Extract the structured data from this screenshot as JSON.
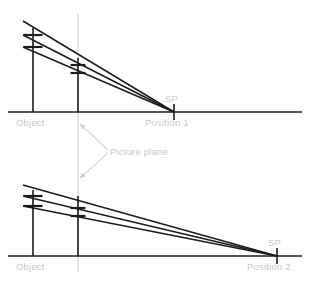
{
  "figure": {
    "background": "#ffffff",
    "line_color": "#1c1c1c",
    "label_color": "#c9c9c9",
    "picture_plane_color": "#d8d8d8",
    "width": 310,
    "height": 283
  },
  "labels": {
    "object": "Object",
    "station_point": "SP",
    "position_1": "Position 1",
    "position_2": "Position 2",
    "picture_plane": "Picture plane"
  },
  "panels": [
    {
      "id": "panel-top",
      "position_label": "Position 1",
      "sp_label": "SP",
      "object_label": "Object",
      "ground_line": {
        "x1": 8,
        "x2": 302,
        "y": 112
      },
      "station_point": {
        "x": 174,
        "y": 112
      },
      "sp_tick": {
        "x": 174,
        "y1": 104,
        "y2": 120
      },
      "object_pole": {
        "x": 33,
        "y_top": 28,
        "y_bottom": 112
      },
      "picture_plane_pole": {
        "x": 78,
        "y_top": 58,
        "y_bottom": 112
      },
      "sight_lines": [
        {
          "name": "top-sight-line",
          "x1": 23,
          "y1": 21,
          "x2": 174,
          "y2": 112
        },
        {
          "name": "middle-sight-line",
          "x1": 23,
          "y1": 35,
          "x2": 174,
          "y2": 112
        },
        {
          "name": "bottom-sight-line",
          "x1": 23,
          "y1": 47,
          "x2": 174,
          "y2": 112
        }
      ],
      "object_ticks": [
        {
          "x": 33,
          "y": 35,
          "w": 19
        },
        {
          "x": 33,
          "y": 47,
          "w": 19
        }
      ],
      "plane_ticks": [
        {
          "x": 78,
          "y": 65,
          "w": 15
        },
        {
          "x": 78,
          "y": 73,
          "w": 15
        }
      ],
      "labels_pos": {
        "object": {
          "x": 16,
          "y": 126
        },
        "sp": {
          "x": 165,
          "y": 102
        },
        "position": {
          "x": 145,
          "y": 126
        }
      }
    },
    {
      "id": "panel-bottom",
      "position_label": "Position 2",
      "sp_label": "SP",
      "object_label": "Object",
      "ground_line": {
        "x1": 8,
        "x2": 302,
        "y": 256
      },
      "station_point": {
        "x": 277,
        "y": 256
      },
      "sp_tick": {
        "x": 277,
        "y1": 248,
        "y2": 264
      },
      "object_pole": {
        "x": 33,
        "y_top": 190,
        "y_bottom": 256
      },
      "picture_plane_pole": {
        "x": 78,
        "y_top": 196,
        "y_bottom": 256
      },
      "sight_lines": [
        {
          "name": "top-sight-line",
          "x1": 23,
          "y1": 185,
          "x2": 277,
          "y2": 256
        },
        {
          "name": "middle-sight-line",
          "x1": 23,
          "y1": 196,
          "x2": 277,
          "y2": 256
        },
        {
          "name": "bottom-sight-line",
          "x1": 23,
          "y1": 206,
          "x2": 277,
          "y2": 256
        }
      ],
      "object_ticks": [
        {
          "x": 33,
          "y": 196,
          "w": 19
        },
        {
          "x": 33,
          "y": 206,
          "w": 19
        }
      ],
      "plane_ticks": [
        {
          "x": 78,
          "y": 208,
          "w": 15
        },
        {
          "x": 78,
          "y": 216,
          "w": 15
        }
      ],
      "labels_pos": {
        "object": {
          "x": 16,
          "y": 270
        },
        "sp": {
          "x": 268,
          "y": 246
        },
        "position": {
          "x": 247,
          "y": 270
        }
      }
    }
  ],
  "picture_plane_line": {
    "x": 78,
    "y1": 14,
    "y2": 272
  },
  "picture_plane_annotation": {
    "label": "Picture plane",
    "label_pos": {
      "x": 110,
      "y": 155
    },
    "arrows": [
      {
        "name": "arrow-up",
        "x1": 108,
        "y1": 150,
        "x2": 80,
        "y2": 124
      },
      {
        "name": "arrow-down",
        "x1": 108,
        "y1": 153,
        "x2": 80,
        "y2": 178
      }
    ]
  }
}
